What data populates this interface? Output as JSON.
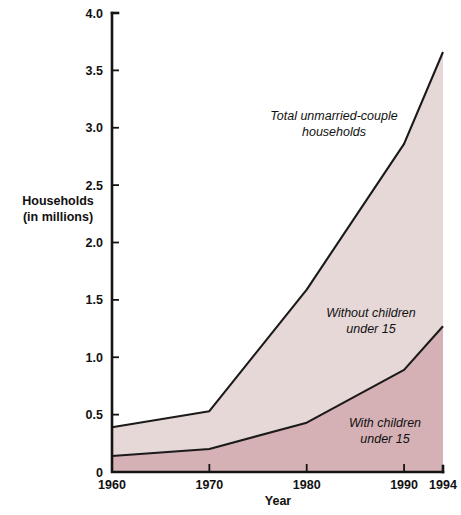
{
  "chart_data": {
    "type": "area",
    "title": "",
    "subtitle": "",
    "xlabel": "Year",
    "ylabel": "Households\n(in millions)",
    "ylabel_line1": "Households",
    "ylabel_line2": "(in millions)",
    "x": [
      1960,
      1970,
      1980,
      1990,
      1994
    ],
    "xlim": [
      1960,
      1994
    ],
    "ylim": [
      0,
      4.0
    ],
    "xticks": [
      1960,
      1970,
      1980,
      1990,
      1994
    ],
    "xticklabels": [
      "1960",
      "1970",
      "1980",
      "1990",
      "1994"
    ],
    "yticks": [
      0,
      0.5,
      1.0,
      1.5,
      2.0,
      2.5,
      3.0,
      3.5,
      4.0
    ],
    "yticklabels": [
      "0",
      "0.5",
      "1.0",
      "1.5",
      "2.0",
      "2.5",
      "3.0",
      "3.5",
      "4.0"
    ],
    "grid": false,
    "legend": "inline-annotations",
    "stacked": true,
    "series": [
      {
        "name": "With children under 15",
        "values": [
          0.14,
          0.2,
          0.43,
          0.89,
          1.27
        ],
        "color": "#d5b0b4"
      },
      {
        "name": "Without children under 15",
        "values": [
          0.25,
          0.33,
          1.16,
          1.97,
          2.39
        ],
        "color": "#e7d8d8"
      }
    ],
    "total_series": {
      "name": "Total unmarried-couple households",
      "values": [
        0.39,
        0.53,
        1.59,
        2.86,
        3.66
      ]
    },
    "annotations": [
      {
        "name": "total-unmarried-couple-households",
        "line1": "Total unmarried-couple",
        "line2": "households",
        "x": 334,
        "y": 120
      },
      {
        "name": "without-children-under-15",
        "line1": "Without children",
        "line2": "under 15",
        "x": 371,
        "y": 317
      },
      {
        "name": "with-children-under-15",
        "line1": "With children",
        "line2": "under 15",
        "x": 385,
        "y": 427
      }
    ],
    "colors": {
      "band_upper": "#e7d8d8",
      "band_lower": "#d5b0b4",
      "line": "#1a1a1a",
      "axis": "#141414",
      "text": "#111111",
      "background": "#ffffff"
    }
  }
}
